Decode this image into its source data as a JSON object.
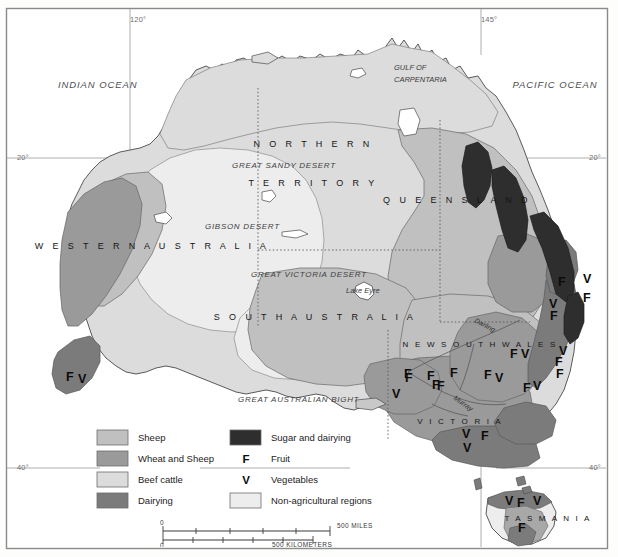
{
  "map": {
    "title": "Australia Agricultural Land Use Map",
    "frame": {
      "border_color": "#8a8a8a",
      "background": "#ffffff"
    },
    "graticule": {
      "longitude_labels": [
        {
          "text": "120°",
          "x": 130,
          "y": 22
        },
        {
          "text": "145°",
          "x": 481,
          "y": 22
        }
      ],
      "latitude_labels": [
        {
          "text": "20°",
          "x": 17,
          "y": 160,
          "align": "start"
        },
        {
          "text": "20°",
          "x": 601,
          "y": 160,
          "align": "end"
        },
        {
          "text": "40°",
          "x": 17,
          "y": 470,
          "align": "start"
        },
        {
          "text": "40°",
          "x": 601,
          "y": 470,
          "align": "end"
        }
      ]
    },
    "ocean_labels": [
      {
        "text": "INDIAN OCEAN",
        "x": 58,
        "y": 88
      },
      {
        "text": "PACIFIC OCEAN",
        "x": 555,
        "y": 88
      }
    ],
    "water_body_labels": [
      {
        "text": "GULF OF",
        "x": 394,
        "y": 70
      },
      {
        "text": "CARPENTARIA",
        "x": 398,
        "y": 82
      },
      {
        "text": "GREAT AUSTRALIAN BIGHT",
        "x": 238,
        "y": 402
      }
    ],
    "desert_labels": [
      {
        "text": "GREAT SANDY DESERT",
        "x": 232,
        "y": 168
      },
      {
        "text": "GIBSON DESERT",
        "x": 205,
        "y": 229
      },
      {
        "text": "GREAT VICTORIA DESERT",
        "x": 251,
        "y": 277
      }
    ],
    "feature_labels": [
      {
        "text": "Lake Eyre",
        "x": 346,
        "y": 293
      }
    ],
    "river_labels": [
      {
        "text": "Darling",
        "x": 474,
        "y": 322,
        "rotate": 28
      },
      {
        "text": "Murray",
        "x": 453,
        "y": 399,
        "rotate": 35
      }
    ],
    "state_labels": [
      {
        "text": "N O R T H E R N",
        "x": 313,
        "y": 147
      },
      {
        "text": "T E R R I T O R Y",
        "x": 313,
        "y": 186
      },
      {
        "text": "W E S T E R N   A U S T R A L I A",
        "x": 152,
        "y": 249
      },
      {
        "text": "Q U E E N S L A N D",
        "x": 457,
        "y": 203
      },
      {
        "text": "S O U T H   A U S T R A L I A",
        "x": 315,
        "y": 320
      },
      {
        "text": "N E W   S O U T H   W A L E S",
        "x": 480,
        "y": 347
      },
      {
        "text": "V I C T O R I A",
        "x": 460,
        "y": 424
      },
      {
        "text": "T A S M A N I A",
        "x": 548,
        "y": 521
      }
    ],
    "crop_markers": [
      {
        "label": "F",
        "x": 66,
        "y": 381
      },
      {
        "label": "V",
        "x": 78,
        "y": 383
      },
      {
        "label": "F",
        "x": 558,
        "y": 286
      },
      {
        "label": "V",
        "x": 549,
        "y": 308
      },
      {
        "label": "F",
        "x": 550,
        "y": 320
      },
      {
        "label": "F",
        "x": 583,
        "y": 302
      },
      {
        "label": "V",
        "x": 583,
        "y": 283
      },
      {
        "label": "F",
        "x": 510,
        "y": 358
      },
      {
        "label": "V",
        "x": 521,
        "y": 358
      },
      {
        "label": "F",
        "x": 484,
        "y": 379
      },
      {
        "label": "V",
        "x": 495,
        "y": 382
      },
      {
        "label": "F",
        "x": 523,
        "y": 392
      },
      {
        "label": "V",
        "x": 533,
        "y": 390
      },
      {
        "label": "F",
        "x": 555,
        "y": 366
      },
      {
        "label": "V",
        "x": 559,
        "y": 355
      },
      {
        "label": "F",
        "x": 556,
        "y": 378
      },
      {
        "label": "F",
        "x": 404,
        "y": 378
      },
      {
        "label": "F",
        "x": 405,
        "y": 382
      },
      {
        "label": "F",
        "x": 427,
        "y": 380
      },
      {
        "label": "F",
        "x": 432,
        "y": 389
      },
      {
        "label": "F",
        "x": 437,
        "y": 390
      },
      {
        "label": "F",
        "x": 450,
        "y": 377
      },
      {
        "label": "V",
        "x": 392,
        "y": 398
      },
      {
        "label": "V",
        "x": 462,
        "y": 438
      },
      {
        "label": "F",
        "x": 481,
        "y": 440
      },
      {
        "label": "V",
        "x": 463,
        "y": 452
      },
      {
        "label": "V",
        "x": 505,
        "y": 505
      },
      {
        "label": "F",
        "x": 517,
        "y": 507
      },
      {
        "label": "V",
        "x": 533,
        "y": 505
      },
      {
        "label": "F",
        "x": 518,
        "y": 532
      }
    ]
  },
  "legend": {
    "items": [
      {
        "label": "Sheep",
        "swatch": "#c0c0c0",
        "type": "swatch"
      },
      {
        "label": "Wheat and Sheep",
        "swatch": "#9a9a9a",
        "type": "swatch"
      },
      {
        "label": "Beef cattle",
        "swatch": "#dcdcdc",
        "type": "swatch"
      },
      {
        "label": "Dairying",
        "swatch": "#7b7b7b",
        "type": "swatch"
      },
      {
        "label": "Sugar and dairying",
        "swatch": "#2e2e2e",
        "type": "swatch"
      },
      {
        "label": "Fruit",
        "key": "F",
        "type": "key"
      },
      {
        "label": "Vegetables",
        "key": "V",
        "type": "key"
      },
      {
        "label": "Non-agricultural regions",
        "swatch": "#ededed",
        "type": "swatch"
      }
    ]
  },
  "scale": {
    "miles": {
      "start": "0",
      "end": "500 MILES"
    },
    "kilometers": {
      "start": "0",
      "end": "500 KILOMETERS"
    }
  },
  "colors": {
    "sheep": "#c0c0c0",
    "wheat_sheep": "#9a9a9a",
    "beef_cattle": "#dcdcdc",
    "dairying": "#7b7b7b",
    "sugar_dairying": "#2e2e2e",
    "non_agricultural": "#ededed",
    "ocean": "#ffffff",
    "coastline": "#4a4a4a",
    "border": "#8a8a8a"
  }
}
